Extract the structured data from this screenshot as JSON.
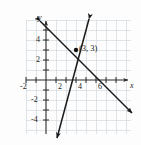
{
  "problem": {
    "number_fragment": "."
  },
  "graph": {
    "axis_labels": {
      "x": "x",
      "y": "y"
    },
    "x_ticks": [
      {
        "value": -2,
        "label": "-2"
      },
      {
        "value": 2,
        "label": "2"
      },
      {
        "value": 4,
        "label": "4"
      },
      {
        "value": 6,
        "label": "6"
      }
    ],
    "y_ticks": [
      {
        "value": 4,
        "label": "4"
      },
      {
        "value": 2,
        "label": "2"
      },
      {
        "value": -2,
        "label": "-2"
      },
      {
        "value": -4,
        "label": "-4"
      }
    ],
    "grid": {
      "visible": true,
      "spacing": 1,
      "color": "#cfd6dd"
    },
    "axis_color": "#2a2a2a",
    "line_color": "#1a1a1a",
    "point_color": "#111111",
    "x_range": [
      -2.8,
      9.2
    ],
    "y_range": [
      -6.2,
      6.3
    ],
    "intersection": {
      "x": 3,
      "y": 3,
      "label": "(3, 3)"
    },
    "lines": [
      {
        "name": "decreasing-line",
        "from": {
          "x": -0.6,
          "y": 5.9
        },
        "to": {
          "x": 8.6,
          "y": -3.3
        },
        "arrow_start": true,
        "arrow_end": true
      },
      {
        "name": "increasing-line",
        "from": {
          "x": 4.3,
          "y": 6.1
        },
        "to": {
          "x": 1.1,
          "y": -5.8
        },
        "arrow_start": true,
        "arrow_end": true
      }
    ]
  }
}
